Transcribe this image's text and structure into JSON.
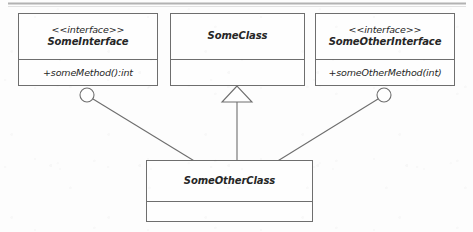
{
  "diagram": {
    "notation": "UML",
    "background_color": "#fdfdfd",
    "line_color": "#6e6e6e",
    "text_color": "#262626",
    "top_rule_color": "#9a9a9a"
  },
  "nodes": [
    {
      "id": "some-interface",
      "kind": "interface",
      "stereotype": "<<interface>>",
      "name": "SomeInterface",
      "members": [
        "+someMethod():int"
      ],
      "empty_compartment": false
    },
    {
      "id": "some-class",
      "kind": "class",
      "stereotype": "",
      "name": "SomeClass",
      "members": [],
      "empty_compartment": true
    },
    {
      "id": "some-other-interface",
      "kind": "interface",
      "stereotype": "<<interface>>",
      "name": "SomeOtherInterface",
      "members": [
        "+someOtherMethod(int)"
      ],
      "empty_compartment": false
    },
    {
      "id": "some-other-class",
      "kind": "class",
      "stereotype": "",
      "name": "SomeOtherClass",
      "members": [],
      "empty_compartment": true
    }
  ],
  "edges": [
    {
      "id": "realization-left",
      "type": "realization-socket",
      "from": "some-other-class",
      "to": "some-interface",
      "marker": "socket-ball"
    },
    {
      "id": "generalization-middle",
      "type": "generalization",
      "from": "some-other-class",
      "to": "some-class",
      "marker": "hollow-triangle"
    },
    {
      "id": "realization-right",
      "type": "realization-socket",
      "from": "some-other-class",
      "to": "some-other-interface",
      "marker": "socket-ball"
    }
  ]
}
